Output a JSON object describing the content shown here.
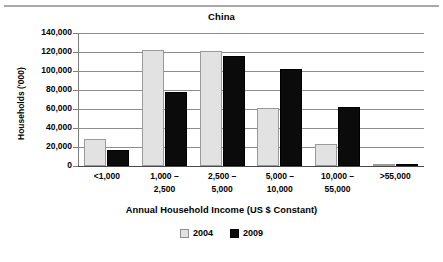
{
  "chart_data": {
    "type": "bar",
    "title": "China",
    "xlabel": "Annual Household Income (US $ Constant)",
    "ylabel": "Households ('000)",
    "categories": [
      "<1,000",
      "1,000 –\n2,500",
      "2,500 –\n5,000",
      "5,000 –\n10,000",
      "10,000 –\n55,000",
      ">55,000"
    ],
    "series": [
      {
        "name": "2004",
        "color": "#e2e2e2",
        "values": [
          28000,
          122000,
          121000,
          61000,
          23500,
          1500
        ]
      },
      {
        "name": "2009",
        "color": "#0b0b0b",
        "values": [
          17000,
          78000,
          116000,
          102500,
          62000,
          2200
        ]
      }
    ],
    "ylim": [
      0,
      140000
    ],
    "ytick_values": [
      0,
      20000,
      40000,
      60000,
      80000,
      100000,
      120000,
      140000
    ],
    "ytick_labels": [
      "0",
      "20,000",
      "40,000",
      "60,000",
      "80,000",
      "100,000",
      "120,000",
      "140,000"
    ],
    "grid": true,
    "legend_position": "bottom-center"
  }
}
